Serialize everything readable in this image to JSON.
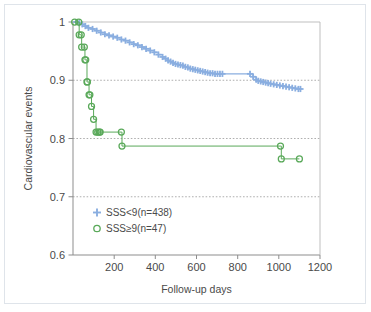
{
  "figure": {
    "kind": "kaplan-meier-survival-plot"
  },
  "chart_data": {
    "type": "line",
    "title": "",
    "subtitle": "",
    "xlabel": "Follow-up days",
    "ylabel": "Cardiovascular events",
    "xlim": [
      0,
      1200
    ],
    "ylim": [
      0.6,
      1.0
    ],
    "xticks": [
      0,
      200,
      400,
      600,
      800,
      1000,
      1200
    ],
    "xticklabels": [
      "",
      "200",
      "400",
      "600",
      "800",
      "1000",
      "1200"
    ],
    "yticks": [
      0.6,
      0.7,
      0.8,
      0.9,
      1.0
    ],
    "yticklabels": [
      "0.6",
      "0.7",
      "0.8",
      "0.9",
      "1"
    ],
    "grid": "horizontal-dotted",
    "gridlines_y": [
      0.7,
      0.8,
      0.9
    ],
    "legend_position": "lower-left-inside",
    "series": [
      {
        "name": "SSS<9(n=438)",
        "label": "SSS<9(n=438)",
        "n": 438,
        "color": "#8aaee0",
        "marker": "plus",
        "step": "post",
        "x": [
          15,
          30,
          45,
          60,
          75,
          95,
          115,
          135,
          155,
          175,
          195,
          215,
          235,
          255,
          275,
          295,
          315,
          335,
          355,
          375,
          395,
          415,
          435,
          450,
          462,
          474,
          486,
          498,
          510,
          522,
          534,
          546,
          558,
          570,
          582,
          594,
          606,
          618,
          630,
          642,
          654,
          666,
          678,
          690,
          702,
          714,
          726,
          860,
          875,
          890,
          900,
          912,
          924,
          936,
          948,
          960,
          975,
          990,
          1005,
          1020,
          1035,
          1050,
          1065,
          1080,
          1095,
          1105
        ],
        "y": [
          1.0,
          0.998,
          0.996,
          0.993,
          0.99,
          0.988,
          0.985,
          0.982,
          0.979,
          0.977,
          0.975,
          0.973,
          0.97,
          0.968,
          0.965,
          0.962,
          0.96,
          0.957,
          0.954,
          0.951,
          0.948,
          0.944,
          0.94,
          0.937,
          0.934,
          0.932,
          0.93,
          0.928,
          0.927,
          0.926,
          0.925,
          0.923,
          0.922,
          0.92,
          0.919,
          0.918,
          0.917,
          0.916,
          0.915,
          0.914,
          0.913,
          0.912,
          0.912,
          0.911,
          0.911,
          0.911,
          0.911,
          0.911,
          0.906,
          0.901,
          0.899,
          0.898,
          0.897,
          0.896,
          0.895,
          0.894,
          0.893,
          0.892,
          0.891,
          0.89,
          0.889,
          0.888,
          0.887,
          0.886,
          0.885,
          0.885
        ]
      },
      {
        "name": "SSS≥9(n=47)",
        "label": "SSS≥9(n=47)",
        "n": 47,
        "color": "#5aa95a",
        "marker": "circle",
        "step": "post",
        "x": [
          8,
          28,
          30,
          40,
          42,
          55,
          58,
          62,
          68,
          70,
          78,
          82,
          90,
          100,
          112,
          120,
          128,
          132,
          235,
          238,
          1008,
          1012,
          1100
        ],
        "y": [
          1.0,
          1.0,
          0.978,
          0.978,
          0.957,
          0.957,
          0.935,
          0.935,
          0.897,
          0.897,
          0.875,
          0.875,
          0.855,
          0.833,
          0.811,
          0.811,
          0.811,
          0.811,
          0.811,
          0.787,
          0.787,
          0.765,
          0.765
        ]
      }
    ],
    "colors": {
      "series_blue": "#8aaee0",
      "series_green": "#5aa95a",
      "axis": "#8d8d8d",
      "grid": "#9a9a9a",
      "text": "#4a4a4a",
      "background": "#ffffff",
      "outer_frame": "#dfe4ea"
    }
  },
  "legend": {
    "entries": [
      {
        "label": "SSS<9(n=438)",
        "marker": "plus-icon",
        "color": "#8aaee0"
      },
      {
        "label": "SSS≥9(n=47)",
        "marker": "circle-icon",
        "color": "#5aa95a"
      }
    ]
  }
}
